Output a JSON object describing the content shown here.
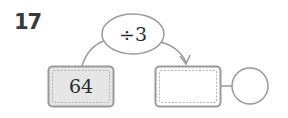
{
  "problem": {
    "number": "17",
    "operation": {
      "label": "÷3"
    },
    "input_box": {
      "value": "64"
    },
    "output_box": {
      "value": ""
    },
    "result_circle": {
      "value": ""
    }
  },
  "colors": {
    "stroke": "#9a9a9a",
    "filled_box": "#e6e6e6",
    "text": "#2a2a2a"
  }
}
